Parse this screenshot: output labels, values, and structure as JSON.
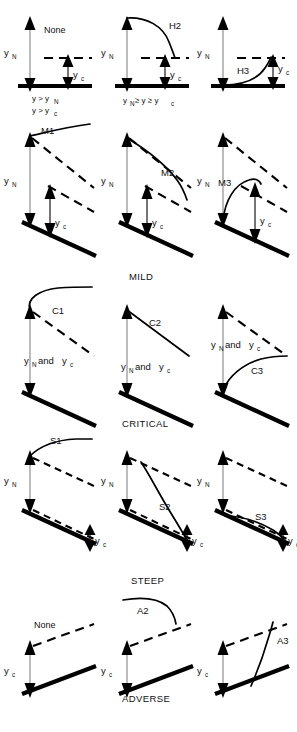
{
  "figure": {
    "depth_normal": "y",
    "depth_normal_sub": "N",
    "depth_critical": "y",
    "depth_critical_sub": "c",
    "and_text": "and",
    "none_text": "None"
  },
  "sections": [
    {
      "id": "horizontal",
      "section_label": "",
      "panels": [
        {
          "id": "h1",
          "profile_label": "None",
          "has_profile_curve": false
        },
        {
          "id": "h2",
          "profile_label": "H2",
          "has_profile_curve": true
        },
        {
          "id": "h3",
          "profile_label": "H3",
          "has_profile_curve": true
        }
      ],
      "inequalities": [
        {
          "line1": "y > y",
          "line1_sub": "N",
          "line2": "y > y",
          "line2_sub": "c"
        },
        {
          "line1": "y",
          "line1_sub": "N",
          "line1_rest": " ≥ y ≥ y",
          "line1_rest_sub": "c"
        }
      ]
    },
    {
      "id": "mild",
      "section_label": "MILD",
      "panels": [
        {
          "id": "m1",
          "profile_label": "M1",
          "depth_label": "yN_yc"
        },
        {
          "id": "m2",
          "profile_label": "M2",
          "depth_label": "yN_yc"
        },
        {
          "id": "m3",
          "profile_label": "M3",
          "depth_label": "yN_yc"
        }
      ]
    },
    {
      "id": "critical",
      "section_label": "CRITICAL",
      "combined_label": "and",
      "panels": [
        {
          "id": "c1",
          "profile_label": "C1"
        },
        {
          "id": "c2",
          "profile_label": "C2"
        },
        {
          "id": "c3",
          "profile_label": "C3"
        }
      ]
    },
    {
      "id": "steep",
      "section_label": "STEEP",
      "panels": [
        {
          "id": "s1",
          "profile_label": "S1"
        },
        {
          "id": "s2",
          "profile_label": "S2"
        },
        {
          "id": "s3",
          "profile_label": "S3"
        }
      ]
    },
    {
      "id": "adverse",
      "section_label": "ADVERSE",
      "panels": [
        {
          "id": "a1",
          "profile_label": "None",
          "has_profile_curve": false
        },
        {
          "id": "a2",
          "profile_label": "A2",
          "has_profile_curve": true
        },
        {
          "id": "a3",
          "profile_label": "A3",
          "has_profile_curve": true
        }
      ]
    }
  ],
  "colors": {
    "ink": "#000000",
    "arrow_gray": "#8a8a8a",
    "background": "#ffffff"
  }
}
